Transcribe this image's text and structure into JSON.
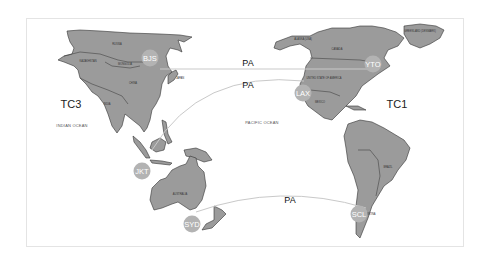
{
  "map": {
    "title": "",
    "colors": {
      "land": "#9b9b9b",
      "city_marker": "#b3b3b3",
      "route": "#c9c9c9",
      "frame": "#e4e4e4"
    },
    "regions": {
      "tc3": "TC3",
      "tc1": "TC1"
    },
    "oceans": {
      "indian": "INDIAN OCEAN",
      "pacific": "PACIFIC OCEAN"
    },
    "countries": {
      "russia": "RUSSIA",
      "kazakhstan": "KAZAKHSTAN",
      "mongolia": "MONGOLIA",
      "china": "CHINA",
      "india": "INDIA",
      "japan": "JAPAN",
      "australia": "AUSTRALIA",
      "alaska": "ALASKA (USA)",
      "canada": "CANADA",
      "usa": "UNITED STATE OF AMERICA",
      "greenland": "GREENLAND (DENMARK)",
      "mexico": "MEXICO",
      "brazil": "BRAZIL",
      "argentina": "ARGENTINA"
    },
    "cities": [
      {
        "code": "BJS",
        "x": 150,
        "y": 58
      },
      {
        "code": "YTO",
        "x": 373,
        "y": 64
      },
      {
        "code": "LAX",
        "x": 303,
        "y": 93
      },
      {
        "code": "JKT",
        "x": 142,
        "y": 171
      },
      {
        "code": "SYD",
        "x": 192,
        "y": 224
      },
      {
        "code": "SCL",
        "x": 359,
        "y": 214
      }
    ],
    "routes": [
      {
        "label": "PA",
        "from": "BJS",
        "to": "YTO"
      },
      {
        "label": "PA",
        "from": "LAX",
        "to": "JKT"
      },
      {
        "label": "PA",
        "from": "SCL",
        "to": "SYD"
      }
    ]
  }
}
